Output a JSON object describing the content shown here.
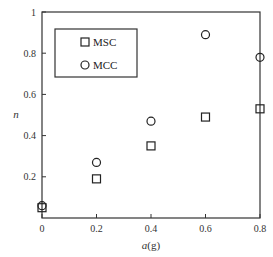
{
  "chart_data": {
    "type": "scatter",
    "title": "",
    "xlabel": "a(g)",
    "ylabel": "n",
    "xlim": [
      0,
      0.8
    ],
    "ylim": [
      0,
      1
    ],
    "x_ticks": [
      "0",
      "0.2",
      "0.4",
      "0.6",
      "0.8"
    ],
    "y_ticks": [
      "0.2",
      "0.4",
      "0.6",
      "0.8",
      "1"
    ],
    "grid": false,
    "legend_position": "upper-left",
    "x": [
      0,
      0.2,
      0.4,
      0.6,
      0.8
    ],
    "series": [
      {
        "name": "MSC",
        "marker": "square",
        "values": [
          0.05,
          0.19,
          0.35,
          0.49,
          0.53
        ]
      },
      {
        "name": "MCC",
        "marker": "circle",
        "values": [
          0.06,
          0.27,
          0.47,
          0.89,
          0.78
        ]
      }
    ]
  },
  "legend": {
    "items": [
      "MSC",
      "MCC"
    ]
  },
  "axes": {
    "xlabel_main": "a",
    "xlabel_unit": "(g)",
    "ylabel": "n"
  }
}
